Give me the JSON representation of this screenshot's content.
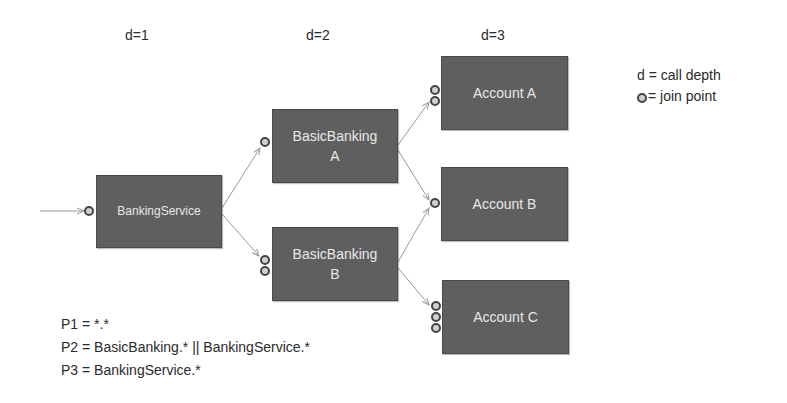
{
  "depth_labels": [
    "d=1",
    "d=2",
    "d=3"
  ],
  "nodes": {
    "banking_service": {
      "label": "BankingService",
      "depth": 1,
      "join_points": 1
    },
    "basic_banking_a": {
      "line1": "BasicBanking",
      "line2": "A",
      "depth": 2,
      "join_points": 1
    },
    "basic_banking_b": {
      "line1": "BasicBanking",
      "line2": "B",
      "depth": 2,
      "join_points": 2
    },
    "account_a": {
      "label": "Account A",
      "depth": 3,
      "join_points": 2
    },
    "account_b": {
      "label": "Account B",
      "depth": 3,
      "join_points": 1
    },
    "account_c": {
      "label": "Account C",
      "depth": 3,
      "join_points": 3
    }
  },
  "edges": [
    [
      "entry",
      "banking_service"
    ],
    [
      "banking_service",
      "basic_banking_a"
    ],
    [
      "banking_service",
      "basic_banking_b"
    ],
    [
      "basic_banking_a",
      "account_a"
    ],
    [
      "basic_banking_a",
      "account_b"
    ],
    [
      "basic_banking_b",
      "account_b"
    ],
    [
      "basic_banking_b",
      "account_c"
    ]
  ],
  "legend": {
    "depth": "d = call depth",
    "join_point": "= join point"
  },
  "pointcuts": [
    "P1 = *.*",
    "P2 = BasicBanking.* || BankingService.*",
    "P3 = BankingService.*"
  ],
  "colors": {
    "box_fill": "#5f5f5f",
    "box_text": "#e8e8e8",
    "join_point_fill": "#d0d0d0",
    "edge": "#9a9a9a"
  }
}
